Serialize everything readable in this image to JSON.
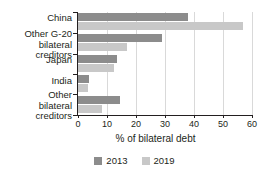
{
  "chart_data": {
    "type": "bar",
    "orientation": "horizontal",
    "title": "",
    "xlabel": "% of bilateral debt",
    "ylabel": "",
    "xlim": [
      0,
      60
    ],
    "xticks": [
      0,
      10,
      20,
      30,
      40,
      50,
      60
    ],
    "xtick_labels": [
      "0",
      "10",
      "20",
      "30",
      "40",
      "50",
      "60"
    ],
    "grid": true,
    "legend_position": "bottom-center",
    "categories": [
      "China",
      "Other G-20\nbilateral creditors",
      "Japan",
      "India",
      "Other\nbilateral creditors"
    ],
    "series": [
      {
        "name": "2013",
        "color": "#8c8c8c",
        "values": [
          38,
          29,
          13.5,
          3.8,
          14.6
        ]
      },
      {
        "name": "2019",
        "color": "#c8c8c8",
        "values": [
          57,
          17,
          12.5,
          3.4,
          8.4
        ]
      }
    ]
  },
  "legend": {
    "items": [
      {
        "label": "2013",
        "color": "#8c8c8c"
      },
      {
        "label": "2019",
        "color": "#c8c8c8"
      }
    ]
  }
}
